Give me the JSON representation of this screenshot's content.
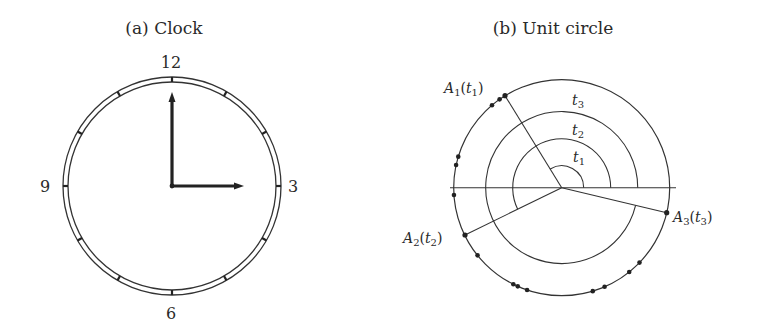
{
  "panels": [
    {
      "id": "a",
      "title": "(a) Clock",
      "numerals": {
        "top": "12",
        "right": "3",
        "bottom": "6",
        "left": "9"
      },
      "hands": {
        "minute_points_to": "12",
        "hour_points_to": "3"
      },
      "tick_count": 12
    },
    {
      "id": "b",
      "title": "(b) Unit circle",
      "arc_labels": [
        {
          "var": "t",
          "sub": "1"
        },
        {
          "var": "t",
          "sub": "2"
        },
        {
          "var": "t",
          "sub": "3"
        }
      ],
      "points": [
        {
          "name": "A",
          "sub": "1",
          "param_var": "t",
          "param_sub": "1",
          "angle_deg": 121.6
        },
        {
          "name": "A",
          "sub": "2",
          "param_var": "t",
          "param_sub": "2",
          "angle_deg": 206.1
        },
        {
          "name": "A",
          "sub": "3",
          "param_var": "t",
          "param_sub": "3",
          "angle_deg": 346.6
        }
      ],
      "scattered_dot_angles_deg": [
        125.1,
        130.2,
        163.3,
        167.9,
        183.9,
        218.8,
        243.4,
        246.0,
        251.3,
        286.7,
        293.4,
        308.7,
        316.1
      ]
    }
  ],
  "colors": {
    "ink": "#333333",
    "background": "#ffffff"
  }
}
